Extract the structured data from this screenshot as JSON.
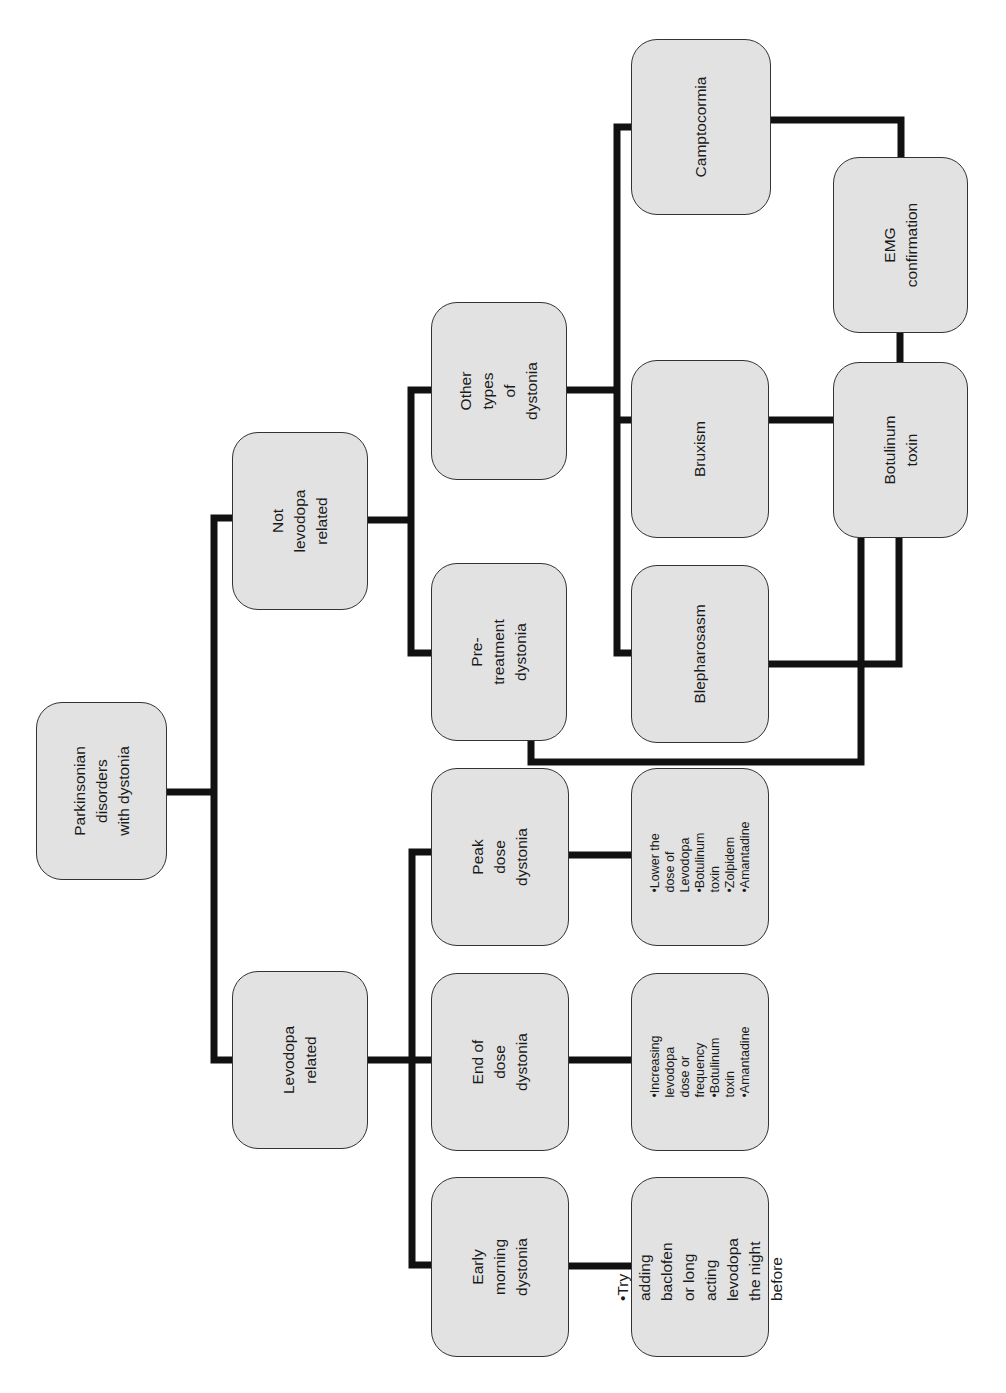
{
  "diagram": {
    "nodes": {
      "root": "Parkinsonian disorders\nwith dystonia",
      "levodopa_related": "Levodopa related",
      "not_levodopa_related": "Not levodopa\nrelated",
      "early_morning": "Early morning\ndystonia",
      "end_of_dose": "End of dose\ndystonia",
      "peak_dose": "Peak dose\ndystonia",
      "pre_treatment": "Pre-treatment\ndystonia",
      "other_types": "Other types\nof dystonia",
      "early_morning_tx": "•Try adding baclofen\nor long acting\nlevodopa the night\nbefore",
      "end_of_dose_tx": "•Increasing levodopa\n  dose or frequency\n•Botulinum toxin\n•Amantadine",
      "peak_dose_tx": "•Lower the dose of\n  Levodopa\n•Botulinum toxin\n•Zolpidem\n•Amantadine",
      "blepharospasm": "Blepharosasm",
      "bruxism": "Bruxism",
      "camptocormia": "Camptocormia",
      "botulinum_toxin": "Botulinum toxin",
      "emg_confirmation": "EMG confirmation"
    },
    "edges": [
      [
        "root",
        "levodopa_related"
      ],
      [
        "root",
        "not_levodopa_related"
      ],
      [
        "levodopa_related",
        "early_morning"
      ],
      [
        "levodopa_related",
        "end_of_dose"
      ],
      [
        "levodopa_related",
        "peak_dose"
      ],
      [
        "not_levodopa_related",
        "pre_treatment"
      ],
      [
        "not_levodopa_related",
        "other_types"
      ],
      [
        "early_morning",
        "early_morning_tx"
      ],
      [
        "end_of_dose",
        "end_of_dose_tx"
      ],
      [
        "peak_dose",
        "peak_dose_tx"
      ],
      [
        "other_types",
        "blepharospasm"
      ],
      [
        "other_types",
        "bruxism"
      ],
      [
        "other_types",
        "camptocormia"
      ],
      [
        "blepharospasm",
        "botulinum_toxin"
      ],
      [
        "bruxism",
        "botulinum_toxin"
      ],
      [
        "pre_treatment",
        "botulinum_toxin"
      ],
      [
        "camptocormia",
        "emg_confirmation"
      ],
      [
        "emg_confirmation",
        "botulinum_toxin"
      ]
    ],
    "colors": {
      "node_fill": "#e2e2e2",
      "node_border": "#333333",
      "connector": "#111111"
    }
  }
}
